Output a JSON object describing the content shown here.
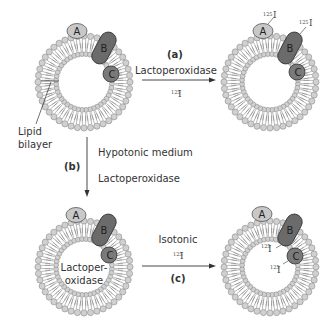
{
  "diagram": {
    "proteins": {
      "a": "A",
      "b": "B",
      "c": "C"
    },
    "colors": {
      "protein_a": "#c8c8c8",
      "protein_b": "#6b6b6b",
      "protein_c": "#7a7a7a",
      "lipid_head": "#d0d0d0",
      "lipid_outline": "#8a8a8a",
      "arrow": "#333333"
    },
    "labels": {
      "lipid_bilayer_line1": "Lipid",
      "lipid_bilayer_line2": "bilayer",
      "step_a": "(a)",
      "step_a_enzyme": "Lactoperoxidase",
      "step_a_reagent_sup": "125",
      "step_a_reagent": "I",
      "step_b": "(b)",
      "step_b_condition": "Hypotonic medium",
      "step_b_enzyme": "Lactoperoxidase",
      "inside_enzyme_line1": "Lactoper-",
      "inside_enzyme_line2": "oxidase",
      "step_c": "(c)",
      "step_c_condition": "Isotonic",
      "step_c_reagent_sup": "125",
      "step_c_reagent": "I"
    },
    "iodine_tags": {
      "sup": "125",
      "element": "I"
    }
  }
}
